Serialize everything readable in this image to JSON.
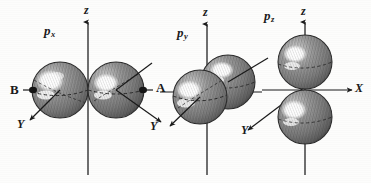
{
  "figure": {
    "background_color": "#fdfdfc",
    "ink_color": "#1a1a1a",
    "sphere_fill": "#8a8a8a",
    "sphere_dark": "#5d5d5d",
    "sphere_highlight": "#ffffff"
  },
  "panels": [
    {
      "id": "px",
      "orbital_label": "p",
      "orbital_subscript": "x",
      "axes": [
        {
          "name": "z",
          "label": "z"
        },
        {
          "name": "y",
          "label": "Y"
        }
      ],
      "lobes": [
        {
          "name": "B",
          "label": "B"
        },
        {
          "name": "A",
          "label": "A"
        }
      ]
    },
    {
      "id": "py",
      "orbital_label": "p",
      "orbital_subscript": "y",
      "axes": [
        {
          "name": "z",
          "label": "z"
        },
        {
          "name": "y",
          "label": "Y"
        }
      ],
      "lobes": []
    },
    {
      "id": "pz",
      "orbital_label": "p",
      "orbital_subscript": "z",
      "axes": [
        {
          "name": "z",
          "label": "z"
        },
        {
          "name": "x",
          "label": "X"
        },
        {
          "name": "y",
          "label": "Y"
        }
      ],
      "lobes": []
    }
  ],
  "labels": {
    "px_orbital_p": "p",
    "px_orbital_sub": "x",
    "py_orbital_p": "p",
    "py_orbital_sub": "y",
    "pz_orbital_p": "p",
    "pz_orbital_sub": "z",
    "z_axis_1": "z",
    "z_axis_2": "z",
    "z_axis_3": "z",
    "y_axis_1": "Y",
    "y_axis_2": "Y",
    "y_axis_3": "Y",
    "x_axis_1": "X",
    "lobe_b": "B",
    "lobe_a": "A"
  }
}
